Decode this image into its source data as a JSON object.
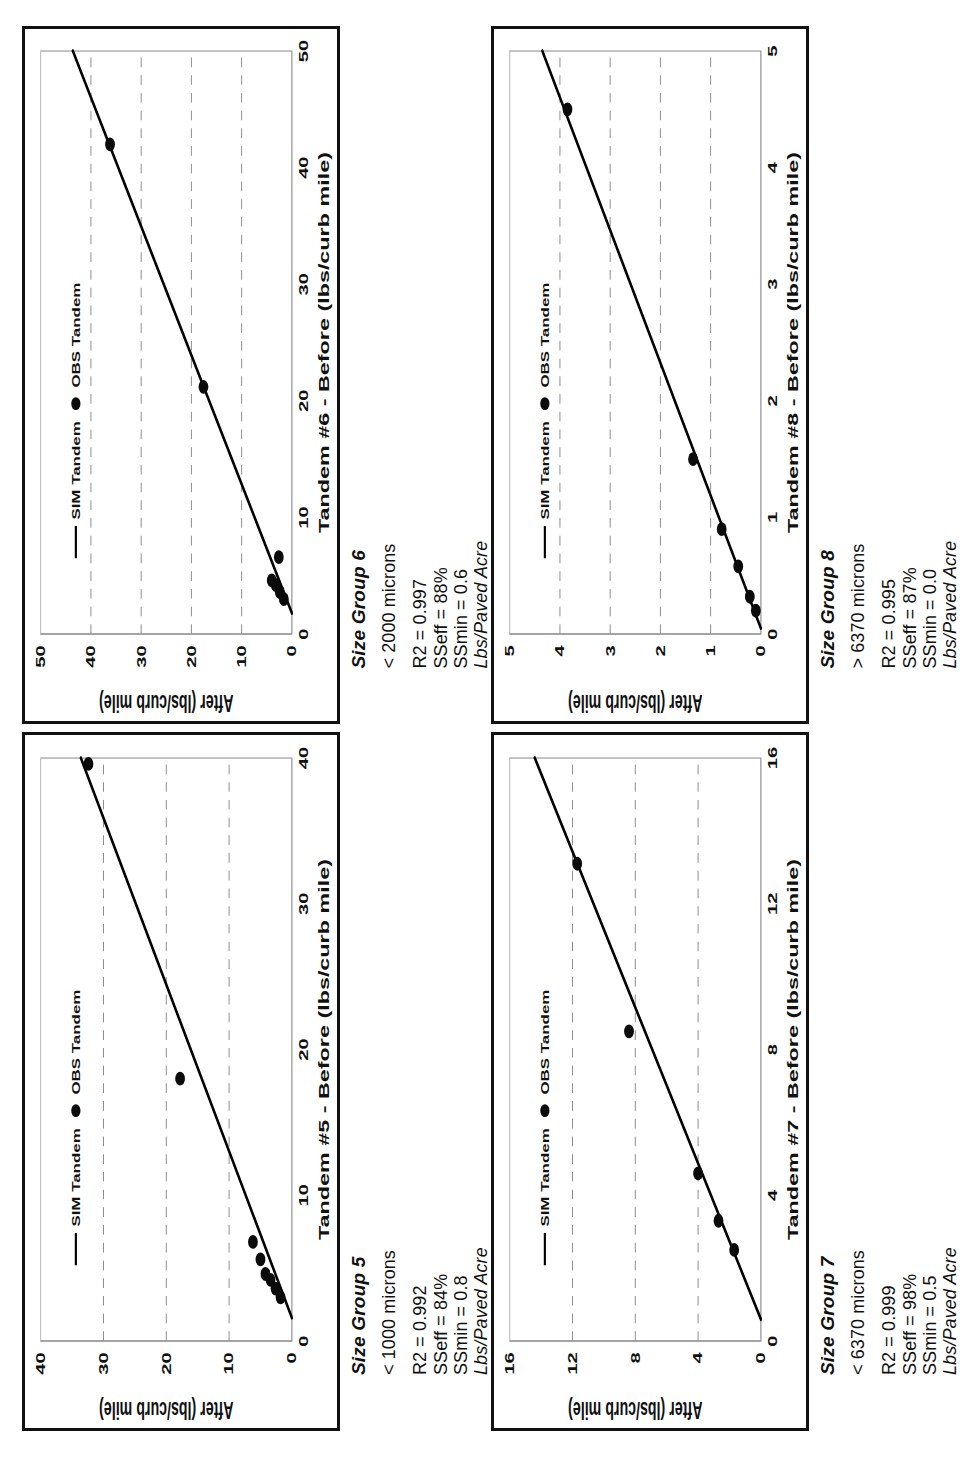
{
  "figure": {
    "orientation": "rotated-90-ccw",
    "legend": {
      "sim_label": "SIM Tandem",
      "obs_label": "OBS Tandem"
    },
    "axis": {
      "y_title": "After (lbs/curb mile)"
    }
  },
  "panels": [
    {
      "id": "size-group-5",
      "title": "Size Group 5",
      "range": "< 1000 microns",
      "r2": "R2 = 0.992",
      "sseff": "SSeff = 84%",
      "ssmin": "SSmin = 0.8",
      "units": "Lbs/Paved Acre",
      "chart_data": {
        "type": "scatter",
        "title": "",
        "xlabel": "Tandem #5 - Before (lbs/curb mile)",
        "ylabel": "After (lbs/curb mile)",
        "xlim": [
          0,
          40
        ],
        "ylim": [
          0,
          40
        ],
        "xticks": [
          0,
          10,
          20,
          30,
          40
        ],
        "yticks": [
          0,
          10,
          20,
          30,
          40
        ],
        "grid": "y-dashed",
        "legend": [
          "SIM Tandem",
          "OBS Tandem"
        ],
        "legend_position": "top-left",
        "series": [
          {
            "name": "OBS Tandem",
            "type": "scatter",
            "points": [
              [
                3.0,
                1.8
              ],
              [
                3.6,
                2.6
              ],
              [
                4.2,
                3.4
              ],
              [
                4.6,
                4.2
              ],
              [
                5.6,
                5.0
              ],
              [
                6.8,
                6.2
              ],
              [
                18.0,
                17.8
              ],
              [
                39.6,
                32.4
              ]
            ]
          },
          {
            "name": "SIM Tandem",
            "type": "line",
            "fit": {
              "x0": 1.6,
              "y0": 0.0,
              "x1": 40.0,
              "y1": 33.6
            }
          }
        ]
      }
    },
    {
      "id": "size-group-6",
      "title": "Size Group 6",
      "range": "< 2000 microns",
      "r2": "R2 = 0.997",
      "sseff": "SSeff = 88%",
      "ssmin": "SSmin = 0.6",
      "units": "Lbs/Paved Acre",
      "chart_data": {
        "type": "scatter",
        "title": "",
        "xlabel": "Tandem #6 - Before (lbs/curb mile)",
        "ylabel": "After (lbs/curb mile)",
        "xlim": [
          0,
          50
        ],
        "ylim": [
          0,
          50
        ],
        "xticks": [
          0,
          10,
          20,
          30,
          40,
          50
        ],
        "yticks": [
          0,
          10,
          20,
          30,
          40,
          50
        ],
        "grid": "y-dashed",
        "legend": [
          "SIM Tandem",
          "OBS Tandem"
        ],
        "legend_position": "top-left",
        "series": [
          {
            "name": "OBS Tandem",
            "type": "scatter",
            "points": [
              [
                3.0,
                1.6
              ],
              [
                3.6,
                2.4
              ],
              [
                4.2,
                3.2
              ],
              [
                4.6,
                4.0
              ],
              [
                6.6,
                2.6
              ],
              [
                21.2,
                17.6
              ],
              [
                42.0,
                36.2
              ]
            ]
          },
          {
            "name": "SIM Tandem",
            "type": "line",
            "fit": {
              "x0": 1.8,
              "y0": 0.0,
              "x1": 50.0,
              "y1": 43.6
            }
          }
        ]
      }
    },
    {
      "id": "size-group-7",
      "title": "Size Group 7",
      "range": "< 6370 microns",
      "r2": "R2 = 0.999",
      "sseff": "SSeff = 98%",
      "ssmin": "SSmin = 0.5",
      "units": "Lbs/Paved Acre",
      "chart_data": {
        "type": "scatter",
        "title": "",
        "xlabel": "Tandem #7 - Before (lbs/curb mile)",
        "ylabel": "After (lbs/curb mile)",
        "xlim": [
          0,
          16
        ],
        "ylim": [
          0,
          16
        ],
        "xticks": [
          0,
          4,
          8,
          12,
          16
        ],
        "yticks": [
          0,
          4,
          8,
          12,
          16
        ],
        "grid": "y-dashed",
        "legend": [
          "SIM Tandem",
          "OBS Tandem"
        ],
        "legend_position": "top-left",
        "series": [
          {
            "name": "OBS Tandem",
            "type": "scatter",
            "points": [
              [
                2.5,
                1.7
              ],
              [
                3.3,
                2.7
              ],
              [
                4.6,
                4.0
              ],
              [
                8.5,
                8.4
              ],
              [
                13.1,
                11.7
              ]
            ]
          },
          {
            "name": "SIM Tandem",
            "type": "line",
            "fit": {
              "x0": 0.6,
              "y0": 0.0,
              "x1": 16.0,
              "y1": 14.4
            }
          }
        ]
      }
    },
    {
      "id": "size-group-8",
      "title": "Size Group 8",
      "range": "> 6370 microns",
      "r2": "R2 = 0.995",
      "sseff": "SSeff = 87%",
      "ssmin": "SSmin = 0.0",
      "units": "Lbs/Paved Acre",
      "chart_data": {
        "type": "scatter",
        "title": "",
        "xlabel": "Tandem #8 - Before (lbs/curb mile)",
        "ylabel": "After (lbs/curb mile)",
        "xlim": [
          0,
          5
        ],
        "ylim": [
          0,
          5
        ],
        "xticks": [
          0,
          1,
          2,
          3,
          4,
          5
        ],
        "yticks": [
          0,
          1,
          2,
          3,
          4,
          5
        ],
        "grid": "y-dashed",
        "legend": [
          "SIM Tandem",
          "OBS Tandem"
        ],
        "legend_position": "top-left",
        "series": [
          {
            "name": "OBS Tandem",
            "type": "scatter",
            "points": [
              [
                0.2,
                0.1
              ],
              [
                0.32,
                0.22
              ],
              [
                0.58,
                0.45
              ],
              [
                0.9,
                0.78
              ],
              [
                1.5,
                1.35
              ],
              [
                4.5,
                3.85
              ]
            ]
          },
          {
            "name": "SIM Tandem",
            "type": "line",
            "fit": {
              "x0": 0.05,
              "y0": 0.0,
              "x1": 5.0,
              "y1": 4.35
            }
          }
        ]
      }
    }
  ]
}
